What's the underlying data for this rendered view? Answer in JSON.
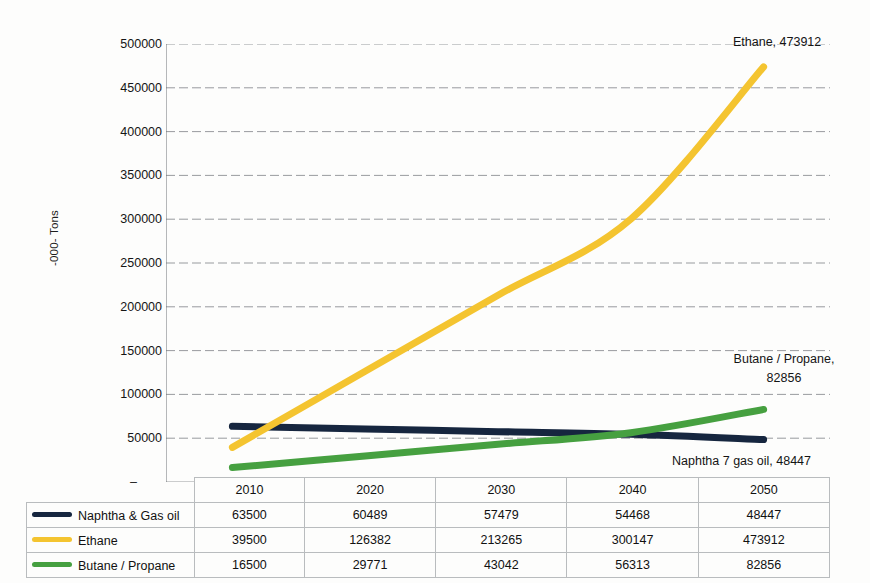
{
  "chart_data": {
    "type": "line",
    "title": "",
    "xlabel": "",
    "ylabel": "-000- Tons",
    "categories": [
      "2010",
      "2020",
      "2030",
      "2040",
      "2050"
    ],
    "ylim": [
      0,
      500000
    ],
    "ytick_step": 50000,
    "ytick_labels": [
      "500000",
      "450000",
      "400000",
      "350000",
      "300000",
      "250000",
      "200000",
      "150000",
      "100000",
      "50000",
      "-"
    ],
    "grid": "horizontal-dashed",
    "legend_position": "data-table-below",
    "smooth_lines": true,
    "series": [
      {
        "name": "Naphtha & Gas oil",
        "color": "#16263f",
        "values": [
          63500,
          60489,
          57479,
          54468,
          48447
        ]
      },
      {
        "name": "Ethane",
        "color": "#f4c430",
        "values": [
          39500,
          126382,
          213265,
          300147,
          473912
        ]
      },
      {
        "name": "Butane / Propane",
        "color": "#46a040",
        "values": [
          16500,
          29771,
          43042,
          56313,
          82856
        ]
      }
    ],
    "annotations": [
      {
        "id": "ethane",
        "text": "Ethane, 473912"
      },
      {
        "id": "butane",
        "text": "Butane / Propane,\n82856"
      },
      {
        "id": "naphtha",
        "text": "Naphtha 7 gas oil, 48447"
      }
    ]
  },
  "table": {
    "header": [
      "2010",
      "2020",
      "2030",
      "2040",
      "2050"
    ],
    "rows": [
      {
        "label": "Naphtha & Gas oil",
        "color": "#16263f",
        "values": [
          "63500",
          "60489",
          "57479",
          "54468",
          "48447"
        ]
      },
      {
        "label": "Ethane",
        "color": "#f4c430",
        "values": [
          "39500",
          "126382",
          "213265",
          "300147",
          "473912"
        ]
      },
      {
        "label": "Butane / Propane",
        "color": "#46a040",
        "values": [
          "16500",
          "29771",
          "43042",
          "56313",
          "82856"
        ]
      }
    ]
  }
}
